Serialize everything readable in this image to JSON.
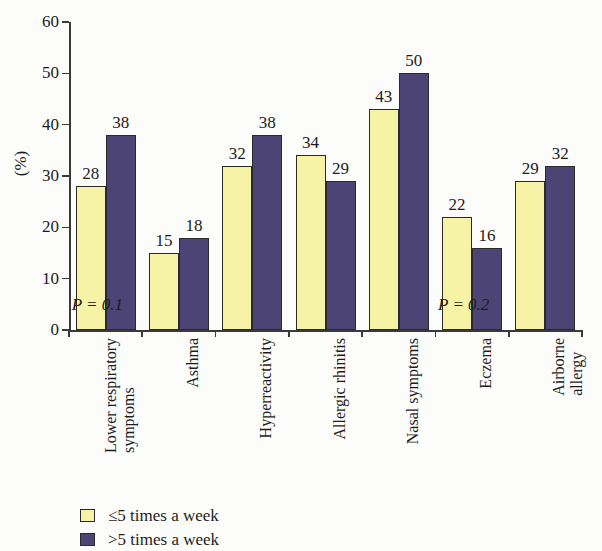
{
  "chart_data": {
    "type": "bar",
    "title": "",
    "subtitle": "",
    "xlabel": "",
    "ylabel": "(%)",
    "ylim": [
      0,
      60
    ],
    "yticks": [
      0,
      10,
      20,
      30,
      40,
      50,
      60
    ],
    "ytick_labels": [
      "0",
      "10",
      "20",
      "30",
      "40",
      "50",
      "60"
    ],
    "grid": false,
    "legend_position": "bottom-left",
    "categories": [
      "Lower respiratory\nsymptoms",
      "Asthma",
      "Hyperreactivity",
      "Allergic rhinitis",
      "Nasal symptoms",
      "Eczema",
      "Airborne allergy"
    ],
    "series": [
      {
        "name": "≤5 times a week",
        "color": "#f7f3a6",
        "values": [
          28,
          15,
          32,
          34,
          43,
          22,
          29
        ]
      },
      {
        "name": ">5 times a week",
        "color": "#4b4474",
        "values": [
          38,
          18,
          38,
          29,
          50,
          16,
          32
        ]
      }
    ],
    "annotations": [
      {
        "text": "P = 0.1",
        "category": "Lower respiratory symptoms",
        "p_symbol": "P",
        "p_value": "0.1"
      },
      {
        "text": "P = 0.2",
        "category": "Eczema",
        "p_symbol": "P",
        "p_value": "0.2"
      }
    ],
    "bar_outline_color": "#2a2a2a",
    "axis_color": "#3a3a3a",
    "background_color": "#fcfcfa"
  },
  "legend": {
    "items": [
      {
        "label": "≤5 times a week",
        "color": "#f7f3a6"
      },
      {
        "label": ">5 times a week",
        "color": "#4b4474"
      }
    ]
  }
}
